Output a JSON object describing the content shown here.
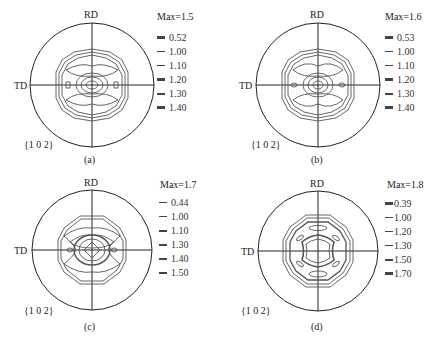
{
  "figure": {
    "panels": [
      {
        "id": "a",
        "caption": "(a)",
        "max_label": "Max=1.5",
        "plane": "{1 0 2}",
        "axis_top": "RD",
        "axis_left": "TD",
        "levels": [
          "0.52",
          "1.00",
          "1.10",
          "1.20",
          "1.30",
          "1.40"
        ]
      },
      {
        "id": "b",
        "caption": "(b)",
        "max_label": "Max=1.6",
        "plane": "{1 0 2}",
        "axis_top": "RD",
        "axis_left": "TD",
        "levels": [
          "0.53",
          "1.00",
          "1.10",
          "1.20",
          "1.30",
          "1.40"
        ]
      },
      {
        "id": "c",
        "caption": "(c)",
        "max_label": "Max=1.7",
        "plane": "{1 0 2}",
        "axis_top": "RD",
        "axis_left": "TD",
        "levels": [
          "0.44",
          "1.00",
          "1.10",
          "1.30",
          "1.40",
          "1.50"
        ]
      },
      {
        "id": "d",
        "caption": "(d)",
        "max_label": "Max=1.8",
        "plane": "{1 0 2}",
        "axis_top": "RD",
        "axis_left": "TD",
        "levels": [
          "0.39",
          "1.00",
          "1.20",
          "1.30",
          "1.50",
          "1.70"
        ]
      }
    ]
  },
  "colors": {
    "ink": "#222222",
    "contour": "#555555",
    "background": "#ffffff"
  }
}
